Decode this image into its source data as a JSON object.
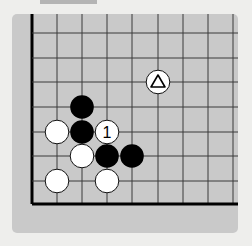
{
  "diagram": {
    "type": "go-board-fragment",
    "colors": {
      "page_background": "#eeeeec",
      "board_background": "#c9c9c9",
      "top_tab": "#b4b4b4",
      "grid_line": "#3a3a3a",
      "edge_line": "#000000",
      "black_stone": "#000000",
      "white_stone": "#ffffff"
    },
    "grid": {
      "vertical_lines_x": [
        32,
        57,
        82,
        107,
        132,
        158,
        183,
        208,
        233
      ],
      "horizontal_lines_y": [
        33,
        58,
        82,
        107,
        132,
        156,
        181,
        204
      ],
      "left_edge": true,
      "bottom_edge": true
    },
    "stones": [
      {
        "color": "black",
        "col": 2,
        "row": 3,
        "label": ""
      },
      {
        "color": "white",
        "col": 1,
        "row": 4,
        "label": ""
      },
      {
        "color": "black",
        "col": 2,
        "row": 4,
        "label": ""
      },
      {
        "color": "white",
        "col": 3,
        "row": 4,
        "label": "1"
      },
      {
        "color": "white",
        "col": 2,
        "row": 5,
        "label": ""
      },
      {
        "color": "black",
        "col": 3,
        "row": 5,
        "label": ""
      },
      {
        "color": "black",
        "col": 4,
        "row": 5,
        "label": ""
      },
      {
        "color": "white",
        "col": 1,
        "row": 6,
        "label": ""
      },
      {
        "color": "white",
        "col": 3,
        "row": 6,
        "label": ""
      },
      {
        "color": "white",
        "col": 5,
        "row": 2,
        "label": "",
        "marker": "triangle"
      }
    ],
    "move_label": "1",
    "marker_icon": "triangle"
  }
}
